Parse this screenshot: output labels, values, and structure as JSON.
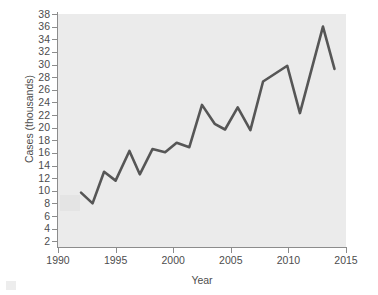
{
  "chart_data": {
    "type": "line",
    "title": "",
    "xlabel": "Year",
    "ylabel": "Cases (thousands)",
    "xlim": [
      1990,
      2015
    ],
    "ylim": [
      0,
      38
    ],
    "grid": false,
    "legend": null,
    "line_color": "#565656",
    "panel_color": "#ebebeb",
    "axis_color": "#8c8c8c",
    "x_ticks": [
      1990,
      1995,
      2000,
      2005,
      2010,
      2015
    ],
    "x_tick_labels": [
      "1990",
      "1995",
      "2000",
      "2005",
      "2010",
      "2015"
    ],
    "y_ticks": [
      2,
      4,
      6,
      8,
      10,
      12,
      14,
      16,
      18,
      20,
      22,
      24,
      26,
      28,
      30,
      32,
      34,
      36,
      38
    ],
    "y_tick_labels": [
      "2",
      "4",
      "6",
      "8",
      "10",
      "12",
      "14",
      "16",
      "18",
      "20",
      "22",
      "24",
      "26",
      "28",
      "30",
      "32",
      "34",
      "36",
      "38"
    ],
    "series": [
      {
        "name": "Cases",
        "x": [
          1992.0,
          1993.0,
          1994.0,
          1995.0,
          1996.2,
          1997.1,
          1998.2,
          1999.3,
          2000.3,
          2001.4,
          2002.5,
          2003.6,
          2004.5,
          2005.6,
          2006.7,
          2007.8,
          2009.9,
          2011.0,
          2013.0,
          2014.0
        ],
        "values": [
          9.7,
          8.0,
          13.0,
          11.6,
          16.3,
          12.6,
          16.6,
          16.1,
          17.6,
          16.9,
          23.6,
          20.6,
          19.7,
          23.2,
          19.6,
          27.3,
          29.8,
          22.3,
          36.0,
          29.3
        ]
      }
    ],
    "annotations": [
      {
        "name": "watermark",
        "text": "",
        "visible_faint": true
      }
    ]
  },
  "axis_titles": {
    "x": "Year",
    "y": "Cases (thousands)"
  },
  "watermark": {
    "line_1": ""
  }
}
